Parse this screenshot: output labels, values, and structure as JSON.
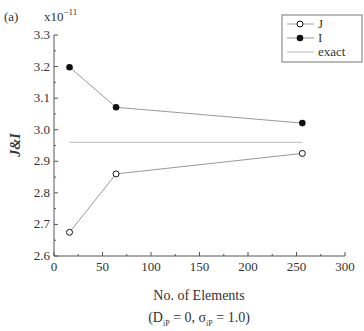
{
  "chart_data": {
    "type": "line",
    "panel_label": "(a)",
    "title": "",
    "xlabel": "No. of Elements",
    "xlabel_sub": "(D_iP = 0, σ_iP = 1.0)",
    "ylabel": "J&I",
    "y_multiplier": "x10^-11",
    "xlim": [
      0,
      300
    ],
    "ylim": [
      2.6,
      3.3
    ],
    "xticks": [
      0,
      50,
      100,
      150,
      200,
      250,
      300
    ],
    "yticks": [
      2.6,
      2.7,
      2.8,
      2.9,
      3.0,
      3.1,
      3.2,
      3.3
    ],
    "grid": false,
    "legend_position": "upper right",
    "x": [
      16,
      64,
      256
    ],
    "series": [
      {
        "name": "J",
        "marker": "open-circle",
        "values": [
          2.675,
          2.86,
          2.925
        ]
      },
      {
        "name": "I",
        "marker": "filled-circle",
        "values": [
          3.198,
          3.071,
          3.021
        ]
      },
      {
        "name": "exact",
        "marker": "none",
        "values": [
          2.96,
          2.96,
          2.96
        ]
      }
    ]
  },
  "labels": {
    "panel": "(a)",
    "multiplier_base": "x10",
    "multiplier_exp": "−11",
    "ylabel": "J&I",
    "xlabel": "No. of Elements",
    "sub_open": "(D",
    "sub_ip1": "iP",
    "sub_mid": " = 0, σ",
    "sub_ip2": "iP",
    "sub_close": " = 1.0)"
  },
  "legend": [
    {
      "label": "J"
    },
    {
      "label": "I"
    },
    {
      "label": "exact"
    }
  ],
  "colors": {
    "axis": "#555555",
    "line": "#999999",
    "exact": "#bbbbbb",
    "marker": "#111111"
  }
}
